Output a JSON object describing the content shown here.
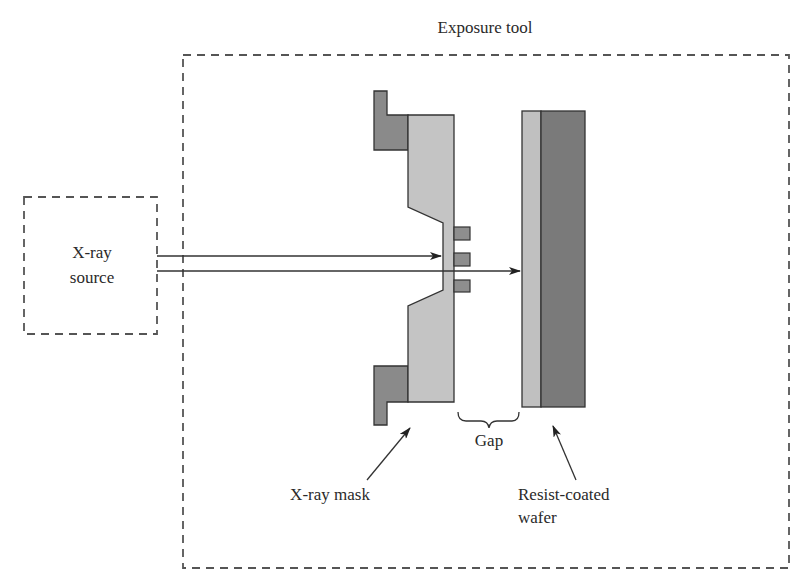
{
  "diagram": {
    "type": "x-ray lithography setup",
    "labels": {
      "exposure_tool": "Exposure tool",
      "source_line1": "X-ray",
      "source_line2": "source",
      "gap": "Gap",
      "mask": "X-ray mask",
      "wafer_line1": "Resist-coated",
      "wafer_line2": "wafer"
    },
    "colors": {
      "holder": "#8a8a8a",
      "membrane": "#c4c4c4",
      "absorber": "#8e8e8e",
      "resist": "#c0c0c0",
      "wafer": "#7a7a7a",
      "stroke": "#333333",
      "dash": "#555555"
    }
  }
}
